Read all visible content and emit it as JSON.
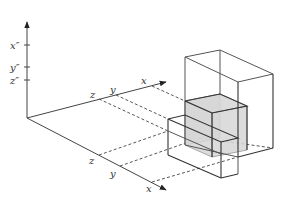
{
  "diagram": {
    "title": "",
    "vertical_axis": {
      "ticks": [
        {
          "label": "x″",
          "y": 45
        },
        {
          "label": "y″",
          "y": 67
        },
        {
          "label": "z″",
          "y": 80
        }
      ]
    },
    "upper_axis": {
      "labels": [
        {
          "label": "z"
        },
        {
          "label": "y"
        },
        {
          "label": "x"
        }
      ]
    },
    "lower_axis": {
      "labels": [
        {
          "label": "z"
        },
        {
          "label": "y"
        },
        {
          "label": "x"
        }
      ]
    },
    "colors": {
      "line": "#444444",
      "shade": "#d6d6d6",
      "background": "#ffffff"
    }
  }
}
